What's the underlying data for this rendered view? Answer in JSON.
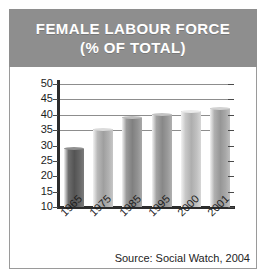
{
  "banner": {
    "line1": "FEMALE LABOUR FORCE",
    "line2": "(% OF TOTAL)",
    "background_color": "#8e8e8e",
    "text_color": "#ffffff"
  },
  "source": {
    "text": "Source: Social Watch, 2004"
  },
  "chart_data": {
    "type": "bar",
    "title": "FEMALE LABOUR FORCE (% OF TOTAL)",
    "subtitle": "(% OF TOTAL)",
    "xlabel": "",
    "ylabel": "",
    "categories": [
      "1965",
      "1975",
      "1985",
      "1995",
      "2000",
      "2001"
    ],
    "values": [
      29,
      35,
      39,
      40,
      41,
      42
    ],
    "ylim": [
      10,
      50
    ],
    "yticks": [
      50,
      45,
      40,
      35,
      30,
      25,
      20,
      15,
      10
    ],
    "ytick_labels": [
      "50",
      "45",
      "40",
      "35",
      "30",
      "25",
      "20",
      "15",
      "10"
    ],
    "gridlines_visible_at": [
      50,
      45,
      40,
      35
    ],
    "grid": true,
    "legend": null,
    "annotations": [
      "Source: Social Watch, 2004"
    ],
    "bar_colors": [
      "#6e6e6e",
      "#b9b9b9",
      "#9a9a9a",
      "#a2a2a2",
      "#c8c8c8",
      "#b0b0b0"
    ],
    "xtick_rotation": -45
  }
}
